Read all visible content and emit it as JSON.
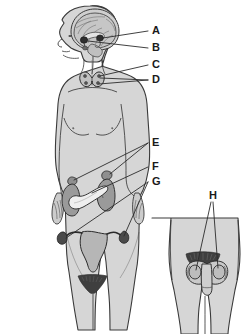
{
  "figure": {
    "colors": {
      "background": "#ffffff",
      "body_fill": "#d6d6d6",
      "body_outline": "#3a3a3a",
      "organ_dark": "#9a9a9a",
      "organ_mid": "#b0b0b0",
      "organ_light": "#efefef",
      "label_text": "#1a1a1a",
      "leader_line": "#2b2b2b",
      "brain_fill": "#c6c6c6",
      "hair_fill": "#4a4a4a"
    }
  },
  "labels": [
    {
      "id": "A",
      "text": "A",
      "x": 152,
      "y": 31,
      "target": "pineal-gland-region"
    },
    {
      "id": "B",
      "text": "B",
      "x": 152,
      "y": 48,
      "target": "pituitary-gland"
    },
    {
      "id": "C",
      "text": "C",
      "x": 152,
      "y": 65,
      "target": "thyroid-gland"
    },
    {
      "id": "D",
      "text": "D",
      "x": 152,
      "y": 80,
      "target": "parathyroid-glands"
    },
    {
      "id": "E",
      "text": "E",
      "x": 152,
      "y": 143,
      "target": "adrenal-gland"
    },
    {
      "id": "F",
      "text": "F",
      "x": 152,
      "y": 167,
      "target": "pancreas"
    },
    {
      "id": "G",
      "text": "G",
      "x": 152,
      "y": 182,
      "target": "ovaries"
    },
    {
      "id": "H",
      "text": "H",
      "x": 210,
      "y": 196,
      "target": "testes"
    }
  ],
  "figures": {
    "female": {
      "name": "female-body-figure",
      "organs": [
        "brain",
        "pineal-gland",
        "pituitary-gland",
        "thyroid-gland",
        "parathyroid-glands",
        "adrenal-glands",
        "kidneys",
        "pancreas",
        "uterus",
        "ovaries"
      ]
    },
    "male": {
      "name": "male-lower-body-inset",
      "organs": [
        "testes"
      ]
    }
  }
}
